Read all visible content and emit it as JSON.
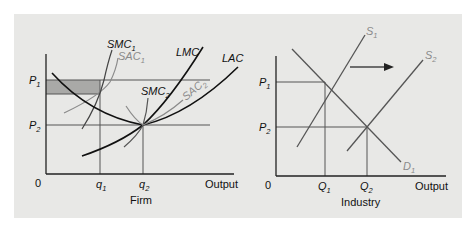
{
  "figure": {
    "background": "#e8e8e6",
    "panels": [
      {
        "id": "firm",
        "caption": "Firm",
        "x_axis_label": "Output",
        "origin_label": "0",
        "y_ticks": [
          {
            "name": "P",
            "sub": "1"
          },
          {
            "name": "P",
            "sub": "2"
          }
        ],
        "x_ticks": [
          {
            "name": "q",
            "sub": "1"
          },
          {
            "name": "q",
            "sub": "2"
          }
        ],
        "curves": [
          {
            "name": "SMC",
            "sub": "1",
            "color": "#222222"
          },
          {
            "name": "SAC",
            "sub": "1",
            "color": "#8a8a8a"
          },
          {
            "name": "LMC",
            "sub": "",
            "color": "#111111"
          },
          {
            "name": "LAC",
            "sub": "",
            "color": "#111111"
          },
          {
            "name": "SMC",
            "sub": "2",
            "color": "#222222"
          },
          {
            "name": "SAC",
            "sub": "2",
            "color": "#8a8a8a"
          }
        ],
        "shaded_area_color": "#a9a9a7"
      },
      {
        "id": "industry",
        "caption": "Industry",
        "x_axis_label": "Output",
        "origin_label": "0",
        "y_ticks": [
          {
            "name": "P",
            "sub": "1"
          },
          {
            "name": "P",
            "sub": "2"
          }
        ],
        "x_ticks": [
          {
            "name": "Q",
            "sub": "1"
          },
          {
            "name": "Q",
            "sub": "2"
          }
        ],
        "curves": [
          {
            "name": "S",
            "sub": "1",
            "color": "#555555"
          },
          {
            "name": "S",
            "sub": "2",
            "color": "#555555"
          },
          {
            "name": "D",
            "sub": "1",
            "color": "#555555"
          }
        ],
        "shift_arrow": "right-arrow"
      }
    ]
  }
}
